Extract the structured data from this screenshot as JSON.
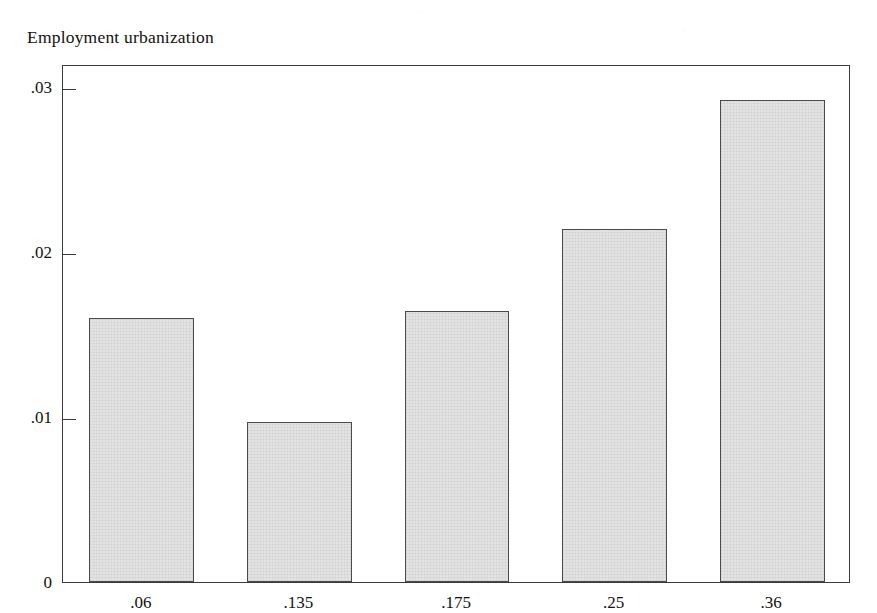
{
  "chart_data": {
    "type": "bar",
    "title": "Employment urbanization",
    "xlabel": "",
    "ylabel": "",
    "categories": [
      ".06",
      ".135",
      ".175",
      ".25",
      ".36"
    ],
    "values": [
      0.016,
      0.0097,
      0.0164,
      0.0214,
      0.0292
    ],
    "ylim": [
      0,
      0.0314
    ],
    "xlim_note": "categorical bars with equal spacing",
    "yticks": [
      0,
      0.01,
      0.02,
      0.03
    ],
    "ytick_labels": [
      "0",
      ".01",
      ".02",
      ".03"
    ],
    "grid": false,
    "legend": null,
    "legend_position": "none",
    "bar_fill_color": "#e2e2e2",
    "bar_edge_color": "#4a4a4a",
    "frame_color": "#3a3a3a",
    "background_color": "#ffffff"
  },
  "axis": {
    "y_ticks": [
      {
        "label": ".03",
        "value": 0.03
      },
      {
        "label": ".02",
        "value": 0.02
      },
      {
        "label": ".01",
        "value": 0.01
      },
      {
        "label": "0",
        "value": 0
      }
    ],
    "x_ticks": [
      {
        "label": ".06"
      },
      {
        "label": ".135"
      },
      {
        "label": ".175"
      },
      {
        "label": ".25"
      },
      {
        "label": ".36"
      }
    ]
  },
  "bars": [
    {
      "category": ".06",
      "value": 0.016
    },
    {
      "category": ".135",
      "value": 0.0097
    },
    {
      "category": ".175",
      "value": 0.0164
    },
    {
      "category": ".25",
      "value": 0.0214
    },
    {
      "category": ".36",
      "value": 0.0292
    }
  ]
}
